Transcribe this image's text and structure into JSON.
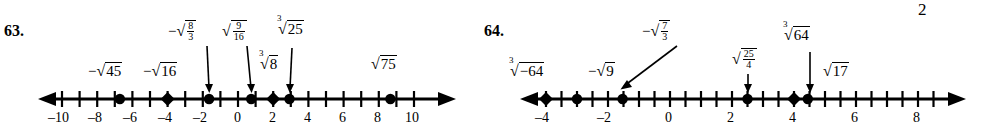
{
  "page": {
    "stray_mark": "2"
  },
  "problems": [
    {
      "number": "63.",
      "axis": {
        "ticks": [
          -10,
          -9,
          -8,
          -7,
          -6,
          -5,
          -4,
          -3,
          -2,
          -1,
          0,
          1,
          2,
          3,
          4,
          5,
          6,
          7,
          8,
          9,
          10
        ],
        "labeled_ticks": [
          {
            "value": -10,
            "label": "–10"
          },
          {
            "value": -8,
            "label": "–8"
          },
          {
            "value": -6,
            "label": "–6"
          },
          {
            "value": -4,
            "label": "–4"
          },
          {
            "value": -2,
            "label": "–2"
          },
          {
            "value": 0,
            "label": "0"
          },
          {
            "value": 2,
            "label": "2"
          },
          {
            "value": 4,
            "label": "4"
          },
          {
            "value": 6,
            "label": "6"
          },
          {
            "value": 8,
            "label": "8"
          },
          {
            "value": 10,
            "label": "10"
          }
        ],
        "range": [
          -11,
          11
        ]
      },
      "points": [
        {
          "value": -6.708,
          "expr": "-√45",
          "shape": "dot"
        },
        {
          "value": -4.0,
          "expr": "-√16",
          "shape": "diamond"
        },
        {
          "value": -1.633,
          "expr": "-√(8/3)",
          "shape": "dot"
        },
        {
          "value": 0.75,
          "expr": "√(9/16)",
          "shape": "dot"
        },
        {
          "value": 2.0,
          "expr": "cube root of 8",
          "shape": "diamond"
        },
        {
          "value": 2.924,
          "expr": "cube root of 25",
          "shape": "dot"
        },
        {
          "value": 8.66,
          "expr": "√75",
          "shape": "dot"
        }
      ],
      "labels": [
        {
          "id": "neg-sqrt-45",
          "type": "plain",
          "sign": "−",
          "index": "",
          "radicand": "45",
          "x": 88,
          "y": 62
        },
        {
          "id": "neg-sqrt-16",
          "type": "plain",
          "sign": "−",
          "index": "",
          "radicand": "16",
          "x": 143,
          "y": 62
        },
        {
          "id": "neg-sqrt-8-3",
          "type": "fraction",
          "sign": "−",
          "index": "",
          "num": "8",
          "den": "3",
          "x": 168,
          "y": 20
        },
        {
          "id": "sqrt-9-16",
          "type": "fraction",
          "sign": "",
          "index": "",
          "num": "9",
          "den": "16",
          "x": 222,
          "y": 20
        },
        {
          "id": "cbrt-8",
          "type": "plain",
          "sign": "",
          "index": "3",
          "radicand": "8",
          "x": 258,
          "y": 56
        },
        {
          "id": "cbrt-25",
          "type": "plain",
          "sign": "",
          "index": "3",
          "radicand": "25",
          "x": 277,
          "y": 20
        },
        {
          "id": "sqrt-75",
          "type": "plain",
          "sign": "",
          "index": "",
          "radicand": "75",
          "x": 370,
          "y": 56
        }
      ]
    },
    {
      "number": "64.",
      "axis": {
        "ticks": [
          -5,
          -4.5,
          -4,
          -3.5,
          -3,
          -2.5,
          -2,
          -1.5,
          -1,
          -0.5,
          0,
          0.5,
          1,
          1.5,
          2,
          2.5,
          3,
          3.5,
          4,
          4.5,
          5,
          5.5,
          6,
          6.5,
          7,
          7.5,
          8,
          8.5
        ],
        "labeled_ticks": [
          {
            "value": -4,
            "label": "–4"
          },
          {
            "value": -2,
            "label": "–2"
          },
          {
            "value": 0,
            "label": "0"
          },
          {
            "value": 2,
            "label": "2"
          },
          {
            "value": 4,
            "label": "4"
          },
          {
            "value": 6,
            "label": "6"
          },
          {
            "value": 8,
            "label": "8"
          }
        ],
        "range": [
          -5.3,
          9
        ]
      },
      "points": [
        {
          "value": -4.0,
          "expr": "cube root of -64",
          "shape": "diamond"
        },
        {
          "value": -3.0,
          "expr": "-√9",
          "shape": "dot"
        },
        {
          "value": -1.528,
          "expr": "-√(7/3)",
          "shape": "dot"
        },
        {
          "value": 2.5,
          "expr": "√(25/4)",
          "shape": "dot"
        },
        {
          "value": 4.0,
          "expr": "cube root of 64",
          "shape": "diamond"
        },
        {
          "value": 4.123,
          "expr": "√17",
          "shape": "dot"
        }
      ],
      "labels": [
        {
          "id": "cbrt-neg-64",
          "type": "plain",
          "sign": "",
          "index": "3",
          "radicand": "−64",
          "x": 48,
          "y": 62
        },
        {
          "id": "neg-sqrt-9",
          "type": "plain",
          "sign": "−",
          "index": "",
          "radicand": "9",
          "x": 110,
          "y": 62
        },
        {
          "id": "neg-sqrt-7-3",
          "type": "fraction",
          "sign": "−",
          "index": "",
          "num": "7",
          "den": "3",
          "x": 162,
          "y": 20
        },
        {
          "id": "sqrt-25-4",
          "type": "fraction",
          "sign": "",
          "index": "",
          "num": "25",
          "den": "4",
          "x": 258,
          "y": 48
        },
        {
          "id": "cbrt-64",
          "type": "plain",
          "sign": "",
          "index": "3",
          "radicand": "64",
          "x": 320,
          "y": 26
        },
        {
          "id": "sqrt-17",
          "type": "plain",
          "sign": "",
          "index": "",
          "radicand": "17",
          "x": 345,
          "y": 62
        }
      ]
    }
  ]
}
